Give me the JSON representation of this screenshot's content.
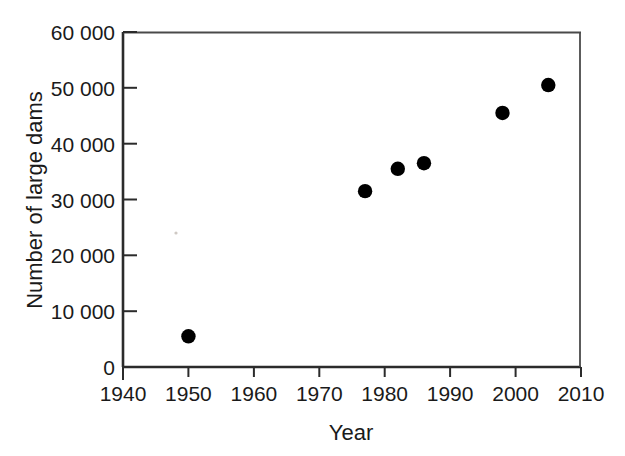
{
  "figure": {
    "background_color": "#ffffff",
    "marker_color": "#000000",
    "axis_color": "#2b2b2b"
  },
  "chart_data": {
    "type": "scatter",
    "title": "",
    "subtitle": "",
    "xlabel": "Year",
    "ylabel": "Number of large dams",
    "xlim": [
      1940,
      2010
    ],
    "ylim": [
      0,
      60000
    ],
    "grid": false,
    "legend": null,
    "legend_position": "none",
    "x_ticks": [
      1940,
      1950,
      1960,
      1970,
      1980,
      1990,
      2000,
      2010
    ],
    "x_tick_labels": [
      "1940",
      "1950",
      "1960",
      "1970",
      "1980",
      "1990",
      "2000",
      "2010"
    ],
    "y_ticks": [
      0,
      10000,
      20000,
      30000,
      40000,
      50000,
      60000
    ],
    "y_tick_labels": [
      "0",
      "10 000",
      "20 000",
      "30 000",
      "40 000",
      "50 000",
      "60 000"
    ],
    "series": [
      {
        "name": "Large dams",
        "marker": "filled-circle",
        "color": "#000000",
        "points": [
          {
            "x": 1950,
            "y": 5500
          },
          {
            "x": 1977,
            "y": 31500
          },
          {
            "x": 1982,
            "y": 35500
          },
          {
            "x": 1986,
            "y": 36500
          },
          {
            "x": 1998,
            "y": 45500
          },
          {
            "x": 2005,
            "y": 50500
          }
        ]
      }
    ],
    "annotations": []
  }
}
